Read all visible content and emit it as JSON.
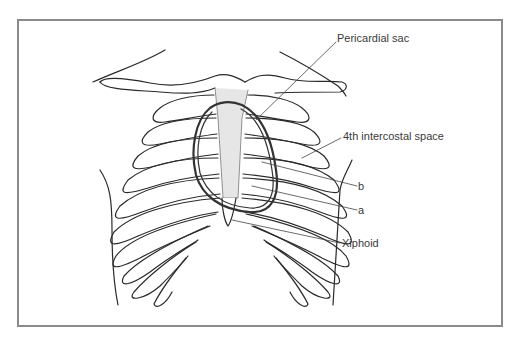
{
  "figure": {
    "labels": [
      {
        "id": "pericardial-sac",
        "text": "Pericardial sac",
        "x": 337,
        "y": 38
      },
      {
        "id": "intercostal-space",
        "text": "4th intercostal space",
        "x": 343,
        "y": 134
      },
      {
        "id": "b",
        "text": "b",
        "x": 360,
        "y": 182
      },
      {
        "id": "a",
        "text": "a",
        "x": 360,
        "y": 206
      },
      {
        "id": "xiphoid",
        "text": "Xiphoid",
        "x": 342,
        "y": 239
      }
    ],
    "colors": {
      "frame": "#8a8a8a",
      "line": "#2a2a2a",
      "sternum_fill": "#e6e6e6",
      "pericardium": "#333333",
      "text": "#3a3a3a"
    }
  }
}
